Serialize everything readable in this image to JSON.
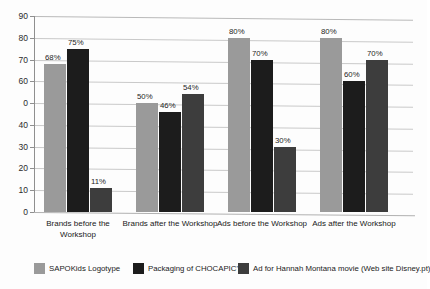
{
  "chart_data": {
    "type": "bar",
    "title": "",
    "subtitle": "",
    "xlabel": "",
    "ylabel": "",
    "ylim": [
      0,
      90
    ],
    "grid": true,
    "legend_position": "bottom",
    "categories": [
      "Brands before the Workshop",
      "Brands after the Workshop",
      "Ads before the Workshop",
      "Ads after the Workshop"
    ],
    "y_tick_labels": [
      "90",
      "80",
      "70",
      "60",
      "0",
      "40",
      "30",
      "20",
      "10",
      "0"
    ],
    "y_tick_values": [
      90,
      80,
      70,
      60,
      50,
      40,
      30,
      20,
      10,
      0
    ],
    "series": [
      {
        "name": "SAPOKids Logotype",
        "color": "#9a9a9a",
        "values": [
          68,
          50,
          80,
          80
        ],
        "labels": [
          "68%",
          "50%",
          "80%",
          "80%"
        ]
      },
      {
        "name": "Packaging of CHOCAPIC's",
        "color": "#1c1c1c",
        "values": [
          75,
          46,
          70,
          60
        ],
        "labels": [
          "75%",
          "46%",
          "70%",
          "60%"
        ]
      },
      {
        "name": "Ad for Hannah Montana movie (Web site Disney.pt)",
        "color": "#3d3d3d",
        "values": [
          11,
          54,
          30,
          70
        ],
        "labels": [
          "11%",
          "54%",
          "30%",
          "70%"
        ]
      }
    ]
  }
}
